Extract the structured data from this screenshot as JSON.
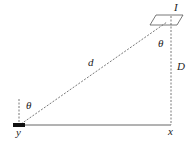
{
  "diagram": {
    "labels": {
      "source": "I",
      "distance": "d",
      "height": "D",
      "angle_top": "θ",
      "angle_bottom": "θ",
      "point_x": "x",
      "point_y": "y"
    },
    "colors": {
      "line": "#555555",
      "text": "#222222",
      "bar": "#111111"
    }
  }
}
